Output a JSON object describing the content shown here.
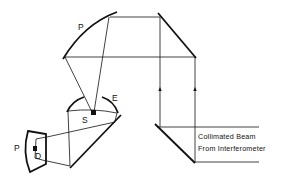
{
  "diagram": {
    "type": "optical-schematic",
    "labels": {
      "upper_mirror": "P",
      "ellipsoid_mirror": "E",
      "source": "S",
      "detector_mirror": "P",
      "detector": "D"
    },
    "caption": {
      "line1": "Collimated Beam",
      "line2": "From Interferometer"
    },
    "colors": {
      "line": "#111111",
      "background": "#ffffff"
    }
  }
}
